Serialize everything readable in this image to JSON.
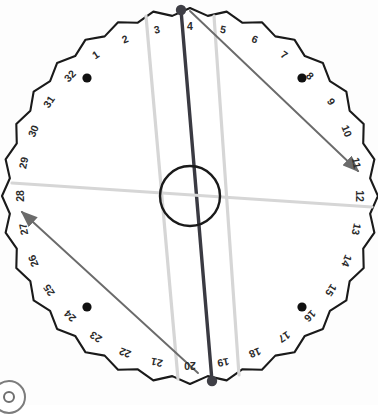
{
  "figure": {
    "type": "diagram",
    "positions_count": 32,
    "tick_labels": [
      "1",
      "2",
      "3",
      "4",
      "5",
      "6",
      "7",
      "8",
      "9",
      "10",
      "11",
      "12",
      "13",
      "14",
      "15",
      "16",
      "17",
      "18",
      "19",
      "20",
      "21",
      "22",
      "23",
      "24",
      "25",
      "26",
      "27",
      "28",
      "29",
      "30",
      "31",
      "32"
    ],
    "badge_icon": "circle-target-icon"
  },
  "colors": {
    "outline": "#1a1a1a",
    "dark_line": "#3a3a42",
    "arrow_line": "#6b6b6b",
    "light_line": "#d6d6d6",
    "dot": "#111111",
    "label": "#2b2b2b",
    "background": "#ffffff"
  },
  "chart_data": {
    "type": "scatter",
    "xlabel": "",
    "ylabel": "",
    "categories": [
      "1",
      "2",
      "3",
      "4",
      "5",
      "6",
      "7",
      "8",
      "9",
      "10",
      "11",
      "12",
      "13",
      "14",
      "15",
      "16",
      "17",
      "18",
      "19",
      "20",
      "21",
      "22",
      "23",
      "24",
      "25",
      "26",
      "27",
      "28",
      "29",
      "30",
      "31",
      "32"
    ],
    "values": [
      1,
      2,
      3,
      4,
      5,
      6,
      7,
      8,
      9,
      10,
      11,
      12,
      13,
      14,
      15,
      16,
      17,
      18,
      19,
      20,
      21,
      22,
      23,
      24,
      25,
      26,
      27,
      28,
      29,
      30,
      31,
      32
    ],
    "geometry": {
      "center_x": 190,
      "center_y": 196,
      "outer_radius": 188,
      "label_radius": 170,
      "hub_radius": 30,
      "notch_count": 32,
      "notch_depth": 7
    },
    "markers": [
      {
        "name": "quadrant-dot-top-left",
        "position_label": "32-1",
        "x": 87,
        "y": 78
      },
      {
        "name": "quadrant-dot-top-right",
        "position_label": "8-9",
        "x": 302,
        "y": 78
      },
      {
        "name": "quadrant-dot-bottom-left",
        "position_label": "24-25",
        "x": 87,
        "y": 307
      },
      {
        "name": "quadrant-dot-bottom-right",
        "position_label": "16-17",
        "x": 302,
        "y": 307
      },
      {
        "name": "endpoint-dot-top",
        "position_label": "4",
        "x": 181,
        "y": 10
      },
      {
        "name": "endpoint-dot-bottom",
        "position_label": "20",
        "x": 212,
        "y": 381
      }
    ],
    "segments": [
      {
        "name": "main-axis-line",
        "style": "dark",
        "from_label": "4",
        "to_label": "20",
        "x1": 181,
        "y1": 10,
        "x2": 212,
        "y2": 381,
        "arrow": false
      },
      {
        "name": "light-line-3-to-21",
        "style": "light",
        "from_label": "3",
        "to_label": "21",
        "x1": 146,
        "y1": 16,
        "x2": 178,
        "y2": 379,
        "arrow": false
      },
      {
        "name": "light-line-5-to-19",
        "style": "light",
        "from_label": "5",
        "to_label": "19",
        "x1": 214,
        "y1": 16,
        "x2": 239,
        "y2": 375,
        "arrow": false
      },
      {
        "name": "light-line-horizontal-28-to-12",
        "style": "light",
        "from_label": "28-29",
        "to_label": "12-13",
        "x1": 12,
        "y1": 183,
        "x2": 372,
        "y2": 207,
        "arrow": false
      },
      {
        "name": "arrow-line-4-to-11",
        "style": "arrow",
        "from_label": "4-5",
        "to_label": "11-12",
        "x1": 190,
        "y1": 11,
        "x2": 358,
        "y2": 171,
        "arrow": true
      },
      {
        "name": "arrow-line-20-to-27",
        "style": "arrow",
        "from_label": "20-21",
        "to_label": "27-28",
        "x1": 198,
        "y1": 373,
        "x2": 22,
        "y2": 212,
        "arrow": true
      }
    ],
    "legend": [],
    "grid": false
  }
}
